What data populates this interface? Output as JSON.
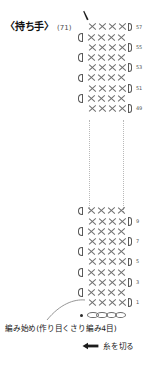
{
  "title": {
    "name": "〈持ち手〉",
    "count": "(71)"
  },
  "chart_data": {
    "type": "table",
    "stitch_symbol": "X",
    "stitches_per_row": 4,
    "total_rows": 57,
    "rows_top": [
      {
        "number": "57",
        "side": "odd",
        "stitches": 4
      },
      {
        "number": "",
        "side": "even",
        "stitches": 4
      },
      {
        "number": "55",
        "side": "odd",
        "stitches": 4
      },
      {
        "number": "",
        "side": "even",
        "stitches": 4
      },
      {
        "number": "53",
        "side": "odd",
        "stitches": 4
      },
      {
        "number": "",
        "side": "even",
        "stitches": 4
      },
      {
        "number": "51",
        "side": "odd",
        "stitches": 4
      },
      {
        "number": "",
        "side": "even",
        "stitches": 4
      },
      {
        "number": "49",
        "side": "odd",
        "stitches": 4
      }
    ],
    "rows_bottom": [
      {
        "number": "",
        "side": "even",
        "stitches": 4
      },
      {
        "number": "9",
        "side": "odd",
        "stitches": 4
      },
      {
        "number": "",
        "side": "even",
        "stitches": 4
      },
      {
        "number": "7",
        "side": "odd",
        "stitches": 4
      },
      {
        "number": "",
        "side": "even",
        "stitches": 4
      },
      {
        "number": "5",
        "side": "odd",
        "stitches": 4
      },
      {
        "number": "",
        "side": "even",
        "stitches": 4
      },
      {
        "number": "3",
        "side": "odd",
        "stitches": 4
      },
      {
        "number": "",
        "side": "even",
        "stitches": 4
      },
      {
        "number": "1",
        "side": "odd",
        "stitches": 4
      }
    ],
    "foundation_chain_count": 4,
    "break_indicator": "dotted-vertical-lines"
  },
  "annotations": {
    "start": "編み始め(作り目くさり編み4目)",
    "cut": "糸を切る"
  }
}
